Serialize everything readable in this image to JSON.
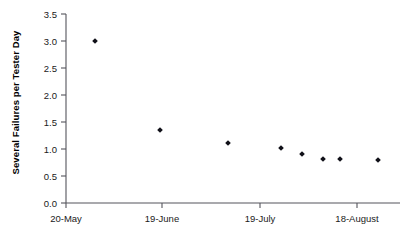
{
  "chart_data": {
    "type": "scatter",
    "title": "",
    "xlabel": "",
    "ylabel": "Several Failures per Tester Day",
    "ylim": [
      0.0,
      3.5
    ],
    "grid": false,
    "legend": null,
    "ytick_labels": [
      "0.0",
      "0.5",
      "1.0",
      "1.5",
      "2.0",
      "2.5",
      "3.0",
      "3.5"
    ],
    "ytick_values": [
      0.0,
      0.5,
      1.0,
      1.5,
      2.0,
      2.5,
      3.0,
      3.5
    ],
    "xtick_labels": [
      "20-May",
      "19-June",
      "19-July",
      "18-August"
    ],
    "xtick_positions": [
      66,
      162,
      260,
      357
    ],
    "marker_style": "filled-diamond",
    "marker_color": "#101018",
    "points": [
      {
        "x_px": 95,
        "y": 3.0
      },
      {
        "x_px": 160,
        "y": 1.36
      },
      {
        "x_px": 228,
        "y": 1.12
      },
      {
        "x_px": 281,
        "y": 1.01
      },
      {
        "x_px": 302,
        "y": 0.9
      },
      {
        "x_px": 323,
        "y": 0.81
      },
      {
        "x_px": 340,
        "y": 0.81
      },
      {
        "x_px": 378,
        "y": 0.8
      }
    ],
    "axis_geometry": {
      "plot_left_px": 66,
      "plot_right_px": 400,
      "plot_top_px": 14,
      "plot_bottom_px": 203
    }
  }
}
